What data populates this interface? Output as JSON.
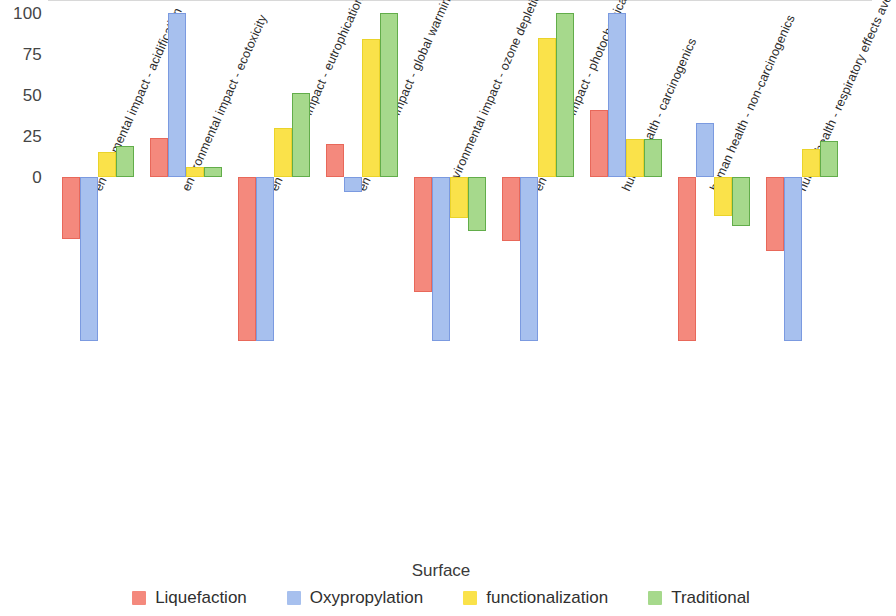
{
  "chart_data": {
    "type": "bar",
    "title": "",
    "xlabel": "",
    "ylabel": "",
    "ylim": [
      -100,
      100
    ],
    "yticks": [
      0,
      25,
      50,
      75,
      100
    ],
    "ytick_labels": [
      "0",
      "25",
      "50",
      "75",
      "100"
    ],
    "grid": false,
    "legend_position": "bottom",
    "legend_title": "Surface",
    "categories": [
      "environmental impact - acidification",
      "environmental impact - ecotoxicity",
      "environmental impact - eutrophication",
      "environmental impact - global warming",
      "environmental impact - ozone depletion",
      "environmental impact - photochemical oxidation",
      "human health - carcinogenics",
      "human health - non-carcinogenics",
      "human health - respiratory effects average"
    ],
    "series": [
      {
        "name": "Liquefaction",
        "color": "#f4897d",
        "values": [
          -38,
          24,
          -100,
          20,
          -70,
          -39,
          41,
          -100,
          -45
        ]
      },
      {
        "name": "Oxypropylation",
        "color": "#a7c0ee",
        "values": [
          -100,
          100,
          -100,
          -9,
          -100,
          -100,
          100,
          33,
          -100
        ]
      },
      {
        "name": "functionalization",
        "color": "#fae24a",
        "values": [
          15,
          6,
          30,
          84,
          -25,
          85,
          23,
          -24,
          17
        ]
      },
      {
        "name": "Traditional",
        "color": "#a6d98c",
        "values": [
          19,
          6,
          51,
          100,
          -33,
          100,
          23,
          -30,
          22
        ]
      }
    ]
  },
  "legend": {
    "title": "Surface",
    "items": [
      {
        "label": "Liquefaction",
        "color": "#f4897d"
      },
      {
        "label": "Oxypropylation",
        "color": "#a7c0ee"
      },
      {
        "label": "functionalization",
        "color": "#fae24a"
      },
      {
        "label": "Traditional",
        "color": "#a6d98c"
      }
    ]
  }
}
